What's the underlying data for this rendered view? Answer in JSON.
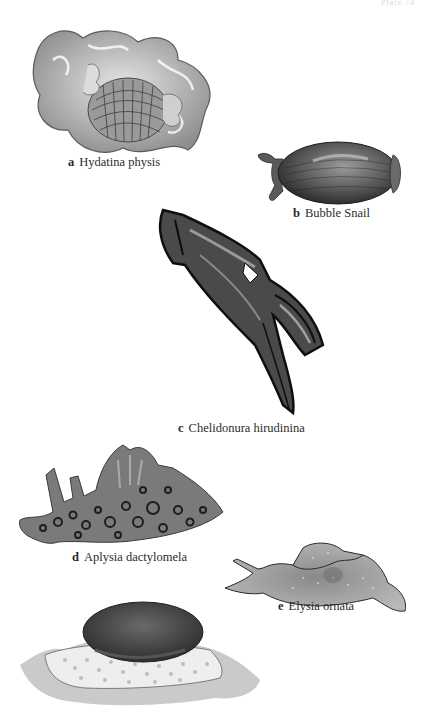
{
  "page": {
    "header_text": "Plate 74"
  },
  "figures": [
    {
      "letter": "a",
      "name": "Hydatina physis"
    },
    {
      "letter": "b",
      "name": "Bubble Snail"
    },
    {
      "letter": "c",
      "name": "Chelidonura hirudinina"
    },
    {
      "letter": "d",
      "name": "Aplysia dactylomela"
    },
    {
      "letter": "e",
      "name": "Elysia ornata"
    },
    {
      "letter": "",
      "name": ""
    }
  ],
  "colors": {
    "background": "#ffffff",
    "ink": "#2b2b2b",
    "dark_slug": "#3a3a3a",
    "mid_gray": "#7a7a7a",
    "light_gray": "#c8c8c8"
  }
}
